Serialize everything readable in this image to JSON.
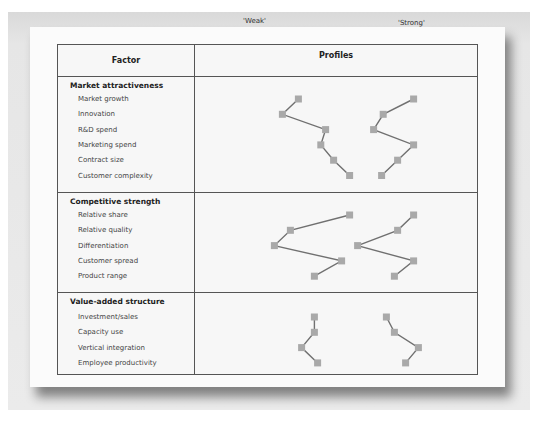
{
  "header": {
    "factor": "Factor",
    "profiles": "Profiles",
    "weak": "'Weak'",
    "strong": "'Strong'"
  },
  "sections": [
    {
      "title": "Market attractiveness",
      "items": [
        "Market growth",
        "Innovation",
        "R&D spend",
        "Marketing spend",
        "Contract size",
        "Customer complexity"
      ]
    },
    {
      "title": "Competitive strength",
      "items": [
        "Relative share",
        "Relative quality",
        "Differentiation",
        "Customer spread",
        "Product range"
      ]
    },
    {
      "title": "Value-added structure",
      "items": [
        "Investment/sales",
        "Capacity use",
        "Vertical integration",
        "Employee productivity"
      ]
    }
  ],
  "colors": {
    "marker": "#a9a9a9",
    "line": "#707070",
    "border": "#555555"
  },
  "chart_data": {
    "type": "line",
    "title": "Profiles",
    "xlabel": "",
    "ylabel": "Factor",
    "xlim": [
      0,
      10
    ],
    "grid": false,
    "legend": "none",
    "series": [
      {
        "name": "'Weak'",
        "sections": [
          [
            2.4,
            1.4,
            4.1,
            3.8,
            4.6,
            5.6
          ],
          [
            5.6,
            1.9,
            0.9,
            5.1,
            3.4
          ],
          [
            3.4,
            3.4,
            2.6,
            3.6
          ]
        ]
      },
      {
        "name": "'Strong'",
        "sections": [
          [
            9.6,
            7.7,
            7.1,
            9.6,
            8.6,
            7.6
          ],
          [
            9.6,
            8.6,
            6.1,
            9.6,
            8.4
          ],
          [
            7.9,
            8.4,
            9.9,
            9.1
          ]
        ]
      }
    ]
  }
}
